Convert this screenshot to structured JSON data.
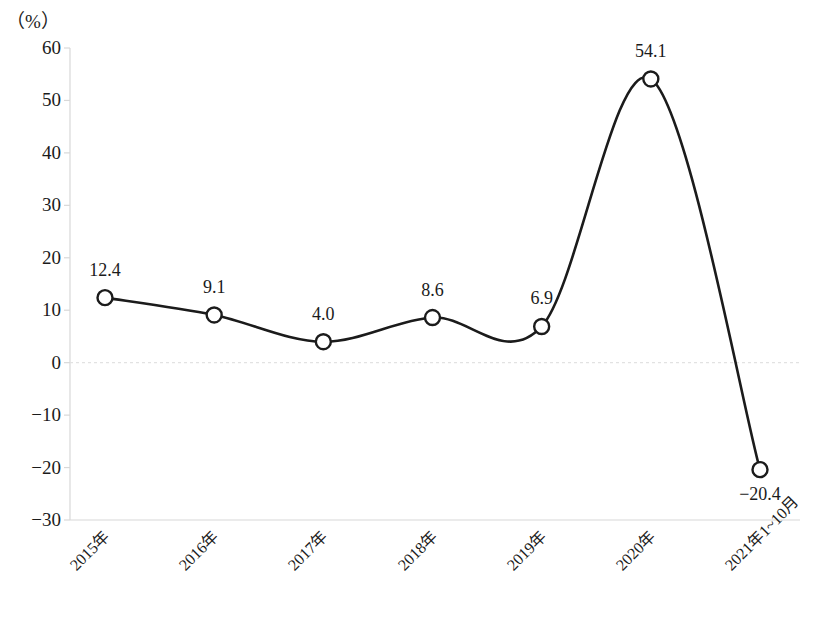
{
  "chart_data": {
    "type": "line",
    "title": "",
    "subtitle": "",
    "xlabel": "",
    "ylabel": "",
    "unit_label": "（%）",
    "categories": [
      "2015年",
      "2016年",
      "2017年",
      "2018年",
      "2019年",
      "2020年",
      "2021年1~10月"
    ],
    "values": [
      12.4,
      9.1,
      4.0,
      8.6,
      6.9,
      54.1,
      -20.4
    ],
    "point_labels": [
      "12.4",
      "9.1",
      "4.0",
      "8.6",
      "6.9",
      "54.1",
      "−20.4"
    ],
    "point_label_position": [
      "above",
      "above",
      "above",
      "above",
      "above",
      "above",
      "below"
    ],
    "ylim": [
      -30,
      60
    ],
    "ytick_values": [
      60,
      50,
      40,
      30,
      20,
      10,
      0,
      -10,
      -20,
      -30
    ],
    "ytick_labels": [
      "60",
      "50",
      "40",
      "30",
      "20",
      "10",
      "0",
      "−10",
      "−20",
      "−30"
    ],
    "grid": false,
    "zero_line": true,
    "legend": "none",
    "series": [
      {
        "name": "",
        "values": [
          12.4,
          9.1,
          4.0,
          8.6,
          6.9,
          54.1,
          -20.4
        ],
        "line_color": "#1b1b1b",
        "marker": "circle",
        "marker_fill": "#ffffff",
        "marker_edge": "#1b1b1b",
        "smooth": true
      }
    ],
    "colors": {
      "line": "#1b1b1b",
      "axis": "#d8d8d8",
      "zero_line": "#e2e2e2",
      "text": "#1b1b1b",
      "background": "#ffffff"
    }
  }
}
